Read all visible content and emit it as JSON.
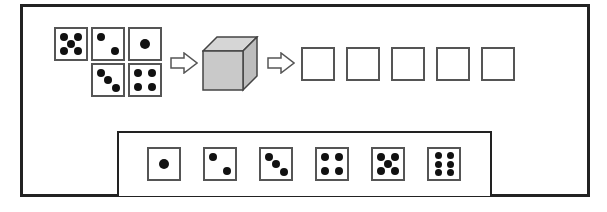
{
  "diagram": {
    "input_dice": [
      {
        "value": 5,
        "x": 54,
        "y": 27
      },
      {
        "value": 2,
        "x": 91,
        "y": 27
      },
      {
        "value": 1,
        "x": 128,
        "y": 27
      },
      {
        "value": 3,
        "x": 91,
        "y": 63
      },
      {
        "value": 4,
        "x": 128,
        "y": 63
      }
    ],
    "arrows": [
      {
        "x": 170,
        "y": 52
      },
      {
        "x": 267,
        "y": 52
      }
    ],
    "cube": {
      "front_color": "#c8c8c8",
      "top_color": "#d4d4d4",
      "side_color": "#b8b8b8"
    },
    "output_boxes": [
      {
        "x": 301
      },
      {
        "x": 346
      },
      {
        "x": 391
      },
      {
        "x": 436
      },
      {
        "x": 481
      }
    ],
    "option_dice": [
      {
        "value": 1,
        "x": 147
      },
      {
        "value": 2,
        "x": 203
      },
      {
        "value": 3,
        "x": 259
      },
      {
        "value": 4,
        "x": 315
      },
      {
        "value": 5,
        "x": 371
      },
      {
        "value": 6,
        "x": 427
      }
    ]
  }
}
